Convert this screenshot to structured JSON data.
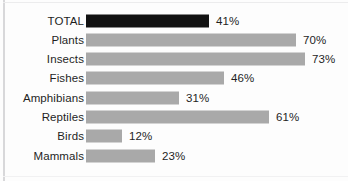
{
  "chart_data": {
    "type": "bar",
    "orientation": "horizontal",
    "title": "",
    "subtitle": "",
    "xlabel": "",
    "ylabel": "",
    "xlim": [
      0,
      100
    ],
    "grid": false,
    "legend": null,
    "value_suffix": "%",
    "categories": [
      "TOTAL",
      "Plants",
      "Insects",
      "Fishes",
      "Amphibians",
      "Reptiles",
      "Birds",
      "Mammals"
    ],
    "values": [
      41,
      70,
      73,
      46,
      31,
      61,
      12,
      23
    ],
    "value_labels": [
      "41%",
      "70%",
      "73%",
      "46%",
      "31%",
      "61%",
      "12%",
      "23%"
    ],
    "bar_colors": [
      "#121212",
      "#a9a9a9",
      "#a9a9a9",
      "#a9a9a9",
      "#a9a9a9",
      "#a9a9a9",
      "#a9a9a9",
      "#a9a9a9"
    ],
    "highlight_category": "TOTAL",
    "rows": [
      {
        "label": "TOTAL",
        "value": 41,
        "value_label": "41%",
        "highlight": true
      },
      {
        "label": "Plants",
        "value": 70,
        "value_label": "70%",
        "highlight": false
      },
      {
        "label": "Insects",
        "value": 73,
        "value_label": "73%",
        "highlight": false
      },
      {
        "label": "Fishes",
        "value": 46,
        "value_label": "46%",
        "highlight": false
      },
      {
        "label": "Amphibians",
        "value": 31,
        "value_label": "31%",
        "highlight": false
      },
      {
        "label": "Reptiles",
        "value": 61,
        "value_label": "61%",
        "highlight": false
      },
      {
        "label": "Birds",
        "value": 12,
        "value_label": "12%",
        "highlight": false
      },
      {
        "label": "Mammals",
        "value": 23,
        "value_label": "23%",
        "highlight": false
      }
    ]
  },
  "style": {
    "bar_color": "#a9a9a9",
    "highlight_color": "#121212",
    "text_color": "#1f1f1f",
    "background": "#fdfdfd",
    "frame_color": "#d8d8da"
  }
}
